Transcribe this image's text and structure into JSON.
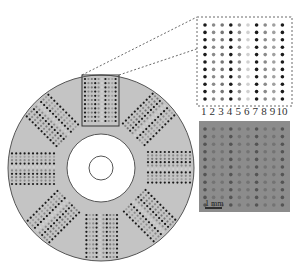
{
  "figure": {
    "type": "microfluidic disk array diagram",
    "disk": {
      "fill": "#c4c4c4",
      "stroke": "#555555",
      "sectors": 8
    },
    "inset": {
      "border_style": "dashed",
      "columns": 10,
      "rows": 11,
      "column_labels": [
        "1",
        "2",
        "3",
        "4",
        "5",
        "6",
        "7",
        "8",
        "9",
        "10"
      ],
      "column_shades": [
        "#1a1a1a",
        "#8a8a8a",
        "#777777",
        "#1a1a1a",
        "#8a8a8a",
        "#d0d0d0",
        "#1a1a1a",
        "#8a8a8a",
        "#a0a0a0",
        "#1a1a1a"
      ]
    },
    "micrograph": {
      "background": "#8c8c8c",
      "scale_bar_label": "1 mm"
    }
  }
}
